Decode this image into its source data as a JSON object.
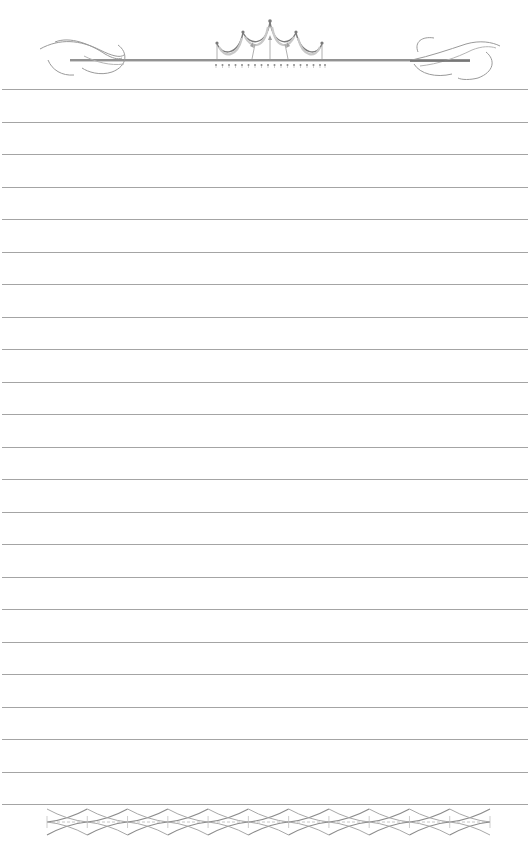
{
  "page": {
    "type": "lined-stationery",
    "background_color": "#ffffff",
    "line_color": "#a4a4a4",
    "ornament_color": "#8a8a8a"
  },
  "header": {
    "ornament_icon": "crown-flourish-icon",
    "left_flourish_icon": "swirl-flourish-icon",
    "right_flourish_icon": "swirl-flourish-icon",
    "bar_y": 60,
    "bar_x_start": 70,
    "bar_x_end": 470
  },
  "ruled_lines": {
    "count": 23,
    "first_y": 89,
    "spacing": 32.5
  },
  "footer": {
    "border_icon": "four-point-star-chain-icon",
    "star_count": 12,
    "x_start": 47,
    "x_end": 490,
    "center_y": 822
  }
}
